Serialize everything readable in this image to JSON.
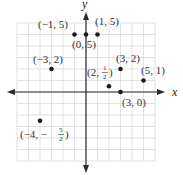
{
  "diagram": {
    "type": "coordinate-plane",
    "axes": {
      "x_label": "x",
      "y_label": "y"
    },
    "grid": {
      "min": -6,
      "max": 6,
      "step": 1
    },
    "colors": {
      "grid": "#d4d4d4",
      "axis": "#2a2a2a",
      "point": "#1a1a1a",
      "text": "#333333"
    },
    "points": [
      {
        "x": -1,
        "y": 5,
        "label": "(−1, 5)"
      },
      {
        "x": 0,
        "y": 5,
        "label": "(0, 5)"
      },
      {
        "x": 1,
        "y": 5,
        "label": "(1, 5)"
      },
      {
        "x": -3,
        "y": 2,
        "label": "(−3, 2)"
      },
      {
        "x": 3,
        "y": 2,
        "label": "(3, 2)"
      },
      {
        "x": 2,
        "y": 0.5,
        "label": "(2, 1/2)"
      },
      {
        "x": 5,
        "y": 1,
        "label": "(5, 1)"
      },
      {
        "x": 3,
        "y": 0,
        "label": "(3, 0)"
      },
      {
        "x": -4,
        "y": -2.5,
        "label": "(−4, −5/2)"
      }
    ]
  }
}
